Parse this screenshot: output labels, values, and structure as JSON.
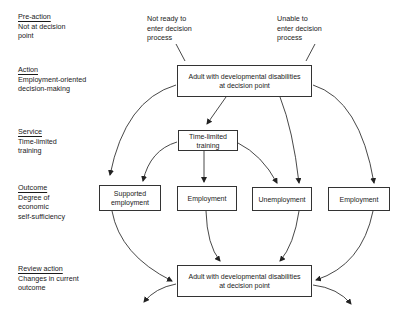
{
  "stages": [
    {
      "heading": "Pre-action",
      "desc": [
        "Not at decision",
        "point"
      ]
    },
    {
      "heading": "Action",
      "desc": [
        "Employment-oriented",
        "decision-making"
      ]
    },
    {
      "heading": "Service",
      "desc": [
        "Time-limited",
        "training"
      ]
    },
    {
      "heading": "Outcome",
      "desc": [
        "Degree of",
        "economic",
        "self-sufficiency"
      ]
    },
    {
      "heading": "Review action",
      "desc": [
        "Changes in current",
        "outcome"
      ]
    }
  ],
  "notes": {
    "not_ready": [
      "Not ready to",
      "enter decision",
      "process"
    ],
    "unable": [
      "Unable to",
      "enter decision",
      "process"
    ]
  },
  "boxes": {
    "top_decision": [
      "Adult with developmental disabilities",
      "at decision point"
    ],
    "training": [
      "Time-limited",
      "training"
    ],
    "supported": [
      "Supported",
      "employment"
    ],
    "employment_mid": [
      "Employment"
    ],
    "unemployment": [
      "Unemployment"
    ],
    "employment_right": [
      "Employment"
    ],
    "bottom_decision": [
      "Adult with developmental disabilities",
      "at decision point"
    ]
  },
  "colors": {
    "line": "#333333",
    "text": "#1a1a1a",
    "background": "#ffffff"
  }
}
